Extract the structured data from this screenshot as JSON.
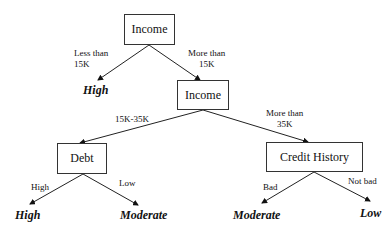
{
  "nodes": {
    "root": {
      "label": "Income"
    },
    "income2": {
      "label": "Income"
    },
    "debt": {
      "label": "Debt"
    },
    "credit": {
      "label": "Credit History"
    }
  },
  "edges": {
    "root_left": {
      "label_line1": "Less than",
      "label_line2": "15K"
    },
    "root_right": {
      "label_line1": "More than",
      "label_line2": "15K"
    },
    "income2_left": {
      "label": "15K-35K"
    },
    "income2_right": {
      "label_line1": "More than",
      "label_line2": "35K"
    },
    "debt_left": {
      "label": "High"
    },
    "debt_right": {
      "label": "Low"
    },
    "credit_left": {
      "label": "Bad"
    },
    "credit_right": {
      "label": "Not bad"
    }
  },
  "leaves": {
    "root_leaf": "High",
    "debt_high": "High",
    "debt_low": "Moderate",
    "credit_bad": "Moderate",
    "credit_notbad": "Low"
  }
}
